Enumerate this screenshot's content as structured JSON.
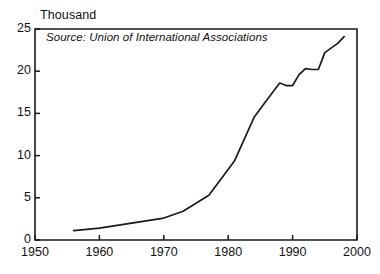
{
  "chart_data": {
    "type": "line",
    "title": "Thousand",
    "subtitle": "",
    "xlabel": "",
    "ylabel": "Thousand",
    "annotation": "Source: Union of International Associations",
    "grid": false,
    "legend": "none",
    "xlim": [
      1950,
      2000
    ],
    "ylim": [
      0,
      25
    ],
    "xticks": [
      1950,
      1960,
      1970,
      1980,
      1990,
      2000
    ],
    "xtick_labels": [
      "1950",
      "1960",
      "1970",
      "1980",
      "1990",
      "2000"
    ],
    "yticks": [
      0,
      5,
      10,
      15,
      20,
      25
    ],
    "ytick_labels": [
      "0",
      "5",
      "10",
      "15",
      "20",
      "25"
    ],
    "line_color": "#1a1a1a",
    "series": [
      {
        "name": "International associations",
        "x": [
          1956,
          1960,
          1965,
          1970,
          1973,
          1977,
          1981,
          1984,
          1986,
          1988,
          1989,
          1990,
          1991,
          1992,
          1993,
          1994,
          1995,
          1997,
          1998
        ],
        "values": [
          1.1,
          1.4,
          2.0,
          2.6,
          3.4,
          5.3,
          9.4,
          14.5,
          16.6,
          18.6,
          18.3,
          18.3,
          19.6,
          20.3,
          20.2,
          20.2,
          22.2,
          23.3,
          24.1
        ]
      }
    ]
  },
  "axis": {
    "units_label": "Thousand"
  }
}
